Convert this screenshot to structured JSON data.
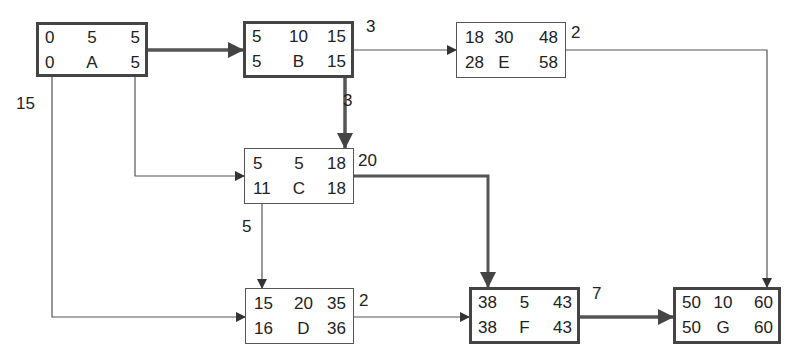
{
  "diagram": {
    "type": "activity-on-node network (critical path)",
    "critical_path": [
      "A",
      "B",
      "C",
      "F",
      "G"
    ],
    "nodes": {
      "A": {
        "es": "0",
        "dur": "5",
        "ef": "5",
        "ls": "0",
        "name": "A",
        "lf": "5",
        "critical": true
      },
      "B": {
        "es": "5",
        "dur": "10",
        "ef": "15",
        "ls": "5",
        "name": "B",
        "lf": "15",
        "critical": true
      },
      "E": {
        "es": "18",
        "dur": "30",
        "ef": "48",
        "ls": "28",
        "name": "E",
        "lf": "58",
        "critical": false
      },
      "C": {
        "es": "5",
        "dur": "5",
        "ef": "18",
        "ls": "11",
        "name": "C",
        "lf": "18",
        "critical": true
      },
      "D": {
        "es": "15",
        "dur": "20",
        "ef": "35",
        "ls": "16",
        "name": "D",
        "lf": "36",
        "critical": false
      },
      "F": {
        "es": "38",
        "dur": "5",
        "ef": "43",
        "ls": "38",
        "name": "F",
        "lf": "43",
        "critical": true
      },
      "G": {
        "es": "50",
        "dur": "10",
        "ef": "60",
        "ls": "50",
        "name": "G",
        "lf": "60",
        "critical": true
      }
    },
    "edges": [
      {
        "from": "A",
        "to": "B",
        "label": "",
        "critical": true
      },
      {
        "from": "B",
        "to": "E",
        "label": "3",
        "critical": false
      },
      {
        "from": "B",
        "to": "C",
        "label": "3",
        "critical": true
      },
      {
        "from": "A",
        "to": "C",
        "label": "",
        "critical": false
      },
      {
        "from": "A",
        "to": "D",
        "label": "15",
        "critical": false
      },
      {
        "from": "C",
        "to": "D",
        "label": "5",
        "critical": false
      },
      {
        "from": "C",
        "to": "F",
        "label": "20",
        "critical": true
      },
      {
        "from": "D",
        "to": "F",
        "label": "2",
        "critical": false
      },
      {
        "from": "E",
        "to": "G",
        "label": "2",
        "critical": false
      },
      {
        "from": "F",
        "to": "G",
        "label": "7",
        "critical": true
      }
    ],
    "edge_labels": {
      "B_E": "3",
      "B_C": "3",
      "A_D": "15",
      "C_D": "5",
      "C_F": "20",
      "D_F": "2",
      "E_G": "2",
      "F_G": "7"
    },
    "colors": {
      "line": "#555555",
      "critical_line": "#444444",
      "text": "#222222",
      "background": "#ffffff"
    }
  }
}
